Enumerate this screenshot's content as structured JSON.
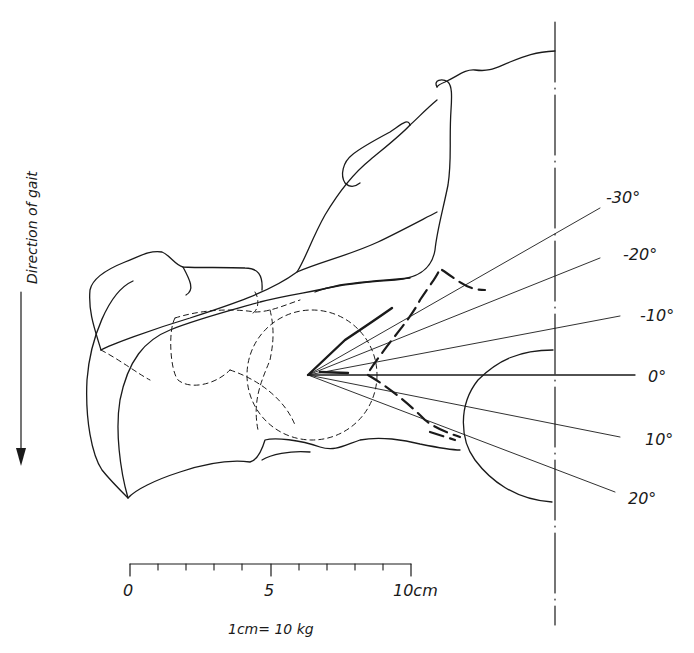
{
  "figure": {
    "direction_label": "Direction of gait",
    "angle_labels": [
      "-30°",
      "-20°",
      "-10°",
      "0°",
      "10°",
      "20°"
    ],
    "scale_bar": {
      "tick_labels": [
        "0",
        "5",
        "10cm"
      ],
      "ticks": 10,
      "conversion": "1cm= 10 kg"
    }
  }
}
